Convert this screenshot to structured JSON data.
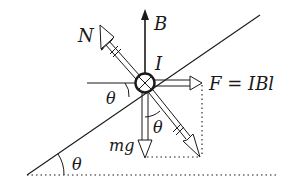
{
  "diagram": {
    "type": "free-body diagram on inclined plane",
    "labels": {
      "magnetic_field": "B",
      "normal_force": "N",
      "current": "I",
      "magnetic_force": "F = IBl",
      "weight": "mg",
      "angle_incline": "θ",
      "angle_at_conductor": "θ",
      "angle_between_mg_and_normal": "θ"
    },
    "colors": {
      "stroke": "#1a1a1a",
      "background": "#ffffff"
    }
  }
}
